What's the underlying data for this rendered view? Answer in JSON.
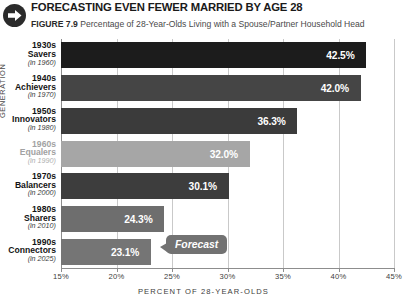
{
  "header": {
    "icon": "arrow-right-circle-icon",
    "title": "FORECASTING EVEN FEWER MARRIED BY AGE 28",
    "figure_number": "FIGURE 7.9",
    "caption": "Percentage of 28-Year-Olds Living with a Spouse/Partner Household Head"
  },
  "annotations": {
    "forecast_label": "Forecast"
  },
  "chart_data": {
    "type": "bar",
    "orientation": "horizontal",
    "title": "FORECASTING EVEN FEWER MARRIED BY AGE 28",
    "subtitle": "Percentage of 28-Year-Olds Living with a Spouse/Partner Household Head",
    "xlabel": "PERCENT OF 28-YEAR-OLDS",
    "ylabel": "GENERATION",
    "xlim": [
      15,
      45
    ],
    "xticks": [
      15,
      20,
      25,
      30,
      35,
      40,
      45
    ],
    "xtick_labels": [
      "15%",
      "20%",
      "25%",
      "30%",
      "35%",
      "40%",
      "45%"
    ],
    "grid": "vertical",
    "legend": "none",
    "categories": [
      "1930s Savers (in 1960)",
      "1940s Achievers (in 1970)",
      "1950s Innovators (in 1980)",
      "1960s Equalers (in 1990)",
      "1970s Balancers (in 2000)",
      "1980s Sharers (in 2010)",
      "1990s Connectors (in 2025)"
    ],
    "values": [
      42.5,
      42.0,
      36.3,
      32.0,
      30.1,
      24.3,
      23.1
    ],
    "value_labels": [
      "42.5%",
      "42.0%",
      "36.3%",
      "32.0%",
      "30.1%",
      "24.3%",
      "23.1%"
    ],
    "bars": [
      {
        "decade": "1930s",
        "name": "Savers",
        "year": "(in 1960)",
        "value": 42.5,
        "label": "42.5%",
        "color": "#1c1c1c",
        "muted": false
      },
      {
        "decade": "1940s",
        "name": "Achievers",
        "year": "(in 1970)",
        "value": 42.0,
        "label": "42.0%",
        "color": "#454545",
        "muted": false
      },
      {
        "decade": "1950s",
        "name": "Innovators",
        "year": "(in 1980)",
        "value": 36.3,
        "label": "36.3%",
        "color": "#3b3b3b",
        "muted": false
      },
      {
        "decade": "1960s",
        "name": "Equalers",
        "year": "(in 1990)",
        "value": 32.0,
        "label": "32.0%",
        "color": "#a6a6a6",
        "muted": true
      },
      {
        "decade": "1970s",
        "name": "Balancers",
        "year": "(in 2000)",
        "value": 30.1,
        "label": "30.1%",
        "color": "#3d3d3d",
        "muted": false
      },
      {
        "decade": "1980s",
        "name": "Sharers",
        "year": "(in 2010)",
        "value": 24.3,
        "label": "24.3%",
        "color": "#6e6e6e",
        "muted": false
      },
      {
        "decade": "1990s",
        "name": "Connectors",
        "year": "(in 2025)",
        "value": 23.1,
        "label": "23.1%",
        "color": "#757575",
        "muted": false
      }
    ]
  },
  "colors": {
    "gridline": "#c9c9c9",
    "axis": "#8d8d8d",
    "value_text": "#ffffff",
    "callout": "#727272"
  }
}
